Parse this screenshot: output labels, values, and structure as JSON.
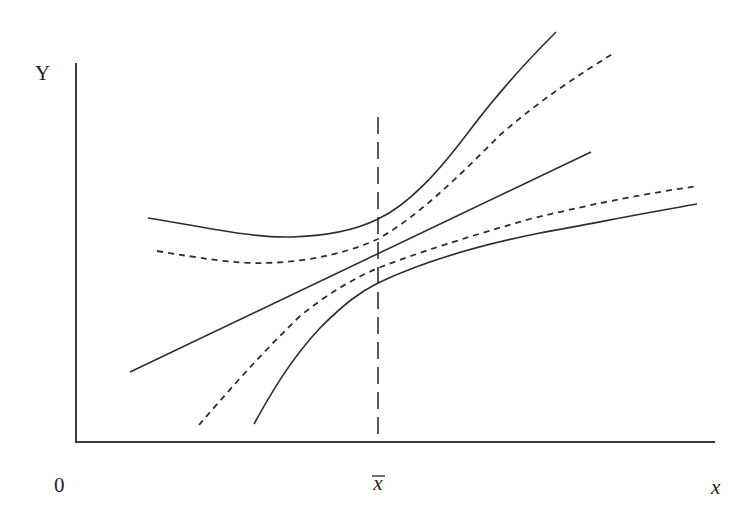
{
  "diagram": {
    "type": "regression-confidence-bands",
    "labels": {
      "y_axis": "Y",
      "x_axis": "x",
      "origin": "0",
      "mean_x": "x",
      "mean_x_overbar": "‾"
    },
    "elements": [
      {
        "name": "regression-line",
        "style": "solid",
        "description": "fitted regression line"
      },
      {
        "name": "inner-band-upper",
        "style": "dashed",
        "description": "upper confidence band for mean response"
      },
      {
        "name": "inner-band-lower",
        "style": "dashed",
        "description": "lower confidence band for mean response"
      },
      {
        "name": "outer-band-upper",
        "style": "solid",
        "description": "upper prediction band"
      },
      {
        "name": "outer-band-lower",
        "style": "solid",
        "description": "lower prediction band"
      },
      {
        "name": "mean-x-line",
        "style": "long-dashed",
        "description": "vertical line at x-bar where bands are narrowest"
      }
    ],
    "colors": {
      "line": "#2e2e2e",
      "axis": "#3a3a3a",
      "background": "#ffffff"
    }
  }
}
